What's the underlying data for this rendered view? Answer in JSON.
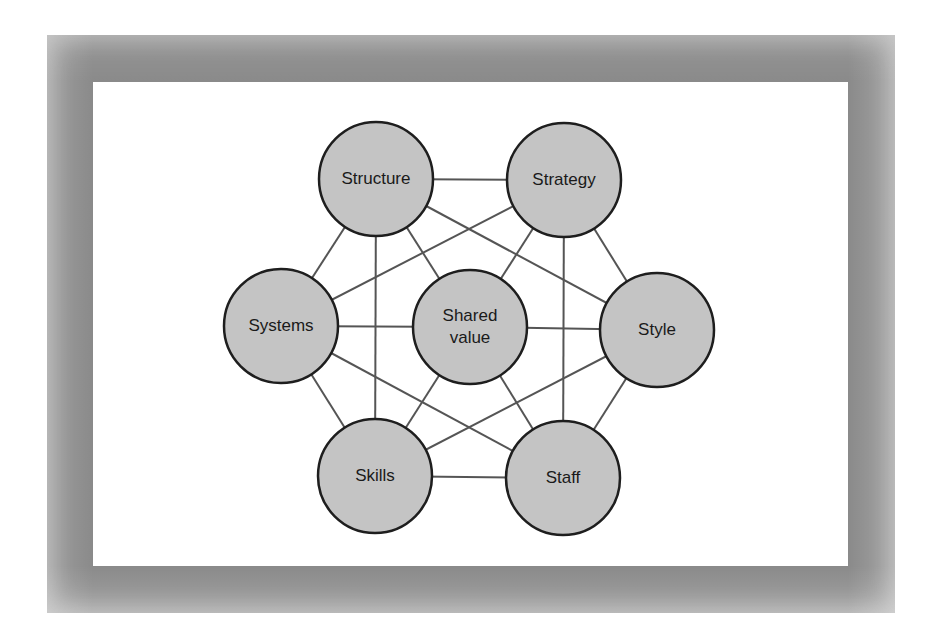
{
  "diagram": {
    "type": "network",
    "frame": {
      "outer_color": "#8a8a8a",
      "inner_color": "#ffffff"
    },
    "node_style": {
      "fill": "#c4c4c4",
      "stroke": "#1e1e1e",
      "radius": 57
    },
    "edge_color": "#555555",
    "nodes": [
      {
        "id": "structure",
        "lines": [
          "Structure"
        ],
        "cx": 376,
        "cy": 179
      },
      {
        "id": "strategy",
        "lines": [
          "Strategy"
        ],
        "cx": 564,
        "cy": 180
      },
      {
        "id": "systems",
        "lines": [
          "Systems"
        ],
        "cx": 281,
        "cy": 326
      },
      {
        "id": "shared",
        "lines": [
          "Shared",
          "value"
        ],
        "cx": 470,
        "cy": 327
      },
      {
        "id": "style",
        "lines": [
          "Style"
        ],
        "cx": 657,
        "cy": 330
      },
      {
        "id": "skills",
        "lines": [
          "Skills"
        ],
        "cx": 375,
        "cy": 476
      },
      {
        "id": "staff",
        "lines": [
          "Staff"
        ],
        "cx": 563,
        "cy": 478
      }
    ],
    "edges": [
      [
        "structure",
        "strategy"
      ],
      [
        "structure",
        "systems"
      ],
      [
        "structure",
        "skills"
      ],
      [
        "structure",
        "shared"
      ],
      [
        "structure",
        "style"
      ],
      [
        "strategy",
        "systems"
      ],
      [
        "strategy",
        "shared"
      ],
      [
        "strategy",
        "staff"
      ],
      [
        "strategy",
        "style"
      ],
      [
        "systems",
        "shared"
      ],
      [
        "systems",
        "skills"
      ],
      [
        "systems",
        "staff"
      ],
      [
        "shared",
        "style"
      ],
      [
        "shared",
        "skills"
      ],
      [
        "shared",
        "staff"
      ],
      [
        "style",
        "skills"
      ],
      [
        "style",
        "staff"
      ],
      [
        "skills",
        "staff"
      ]
    ]
  }
}
